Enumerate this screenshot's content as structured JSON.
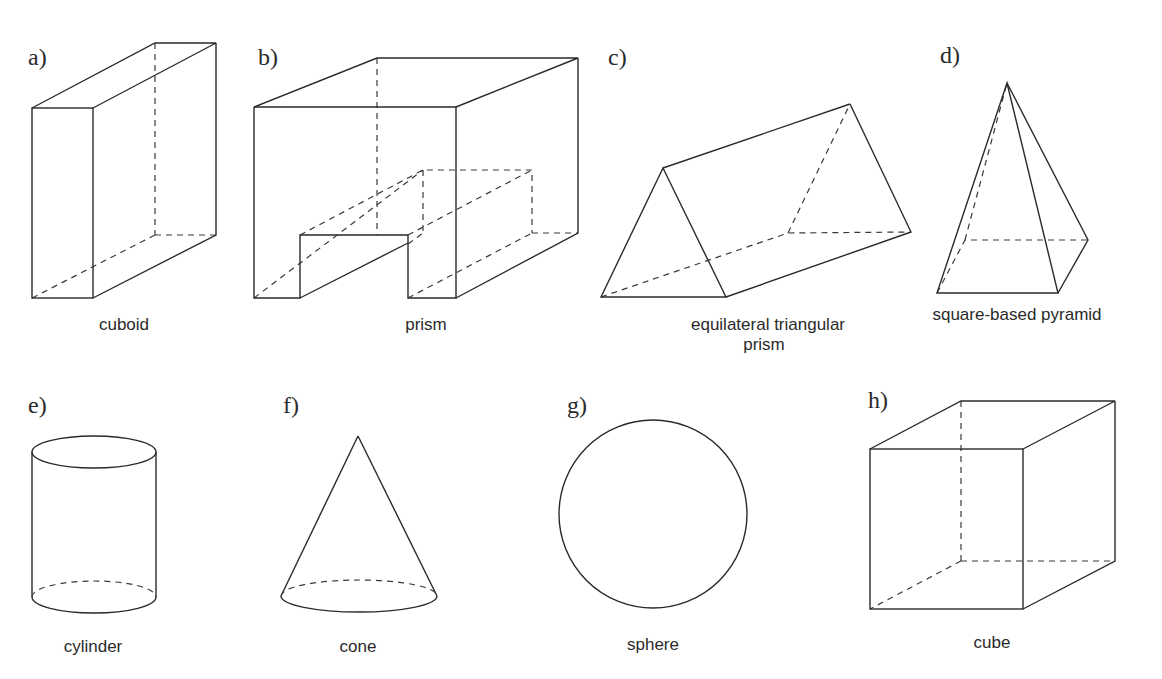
{
  "figure": {
    "shapes": [
      {
        "letter": "a)",
        "name": "cuboid",
        "caption_lines": [
          "cuboid"
        ]
      },
      {
        "letter": "b)",
        "name": "prism",
        "caption_lines": [
          "prism"
        ]
      },
      {
        "letter": "c)",
        "name": "equilateral-triangular-prism",
        "caption_lines": [
          "equilateral triangular",
          "prism"
        ]
      },
      {
        "letter": "d)",
        "name": "square-based-pyramid",
        "caption_lines": [
          "square-based pyramid"
        ]
      },
      {
        "letter": "e)",
        "name": "cylinder",
        "caption_lines": [
          "cylinder"
        ]
      },
      {
        "letter": "f)",
        "name": "cone",
        "caption_lines": [
          "cone"
        ]
      },
      {
        "letter": "g)",
        "name": "sphere",
        "caption_lines": [
          "sphere"
        ]
      },
      {
        "letter": "h)",
        "name": "cube",
        "caption_lines": [
          "cube"
        ]
      }
    ]
  },
  "colors": {
    "line": "#2a2a2a",
    "background": "#ffffff"
  }
}
